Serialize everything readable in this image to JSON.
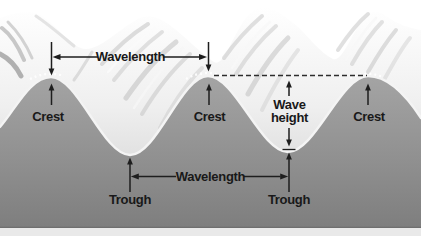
{
  "diagram": {
    "name": "ocean-wave-anatomy",
    "labels": {
      "wavelength_top": "Wavelength",
      "wavelength_bottom": "Wavelength",
      "crest_left": "Crest",
      "crest_center": "Crest",
      "crest_right": "Crest",
      "trough_left": "Trough",
      "trough_right": "Trough",
      "wave_height_line1": "Wave",
      "wave_height_line2": "height"
    },
    "palette": {
      "sky": "#ffffff",
      "wave_face_light": "#f6f6f6",
      "wave_face_shadow": "#bdbdbd",
      "water_top": "#a2a2a2",
      "water_bottom": "#7e7e7e",
      "surface_line": "#f4f4f4",
      "annotation": "#1e1e1e",
      "dashed_line": "#2d2d2d",
      "footer_strip": "#e9e9e9"
    }
  }
}
